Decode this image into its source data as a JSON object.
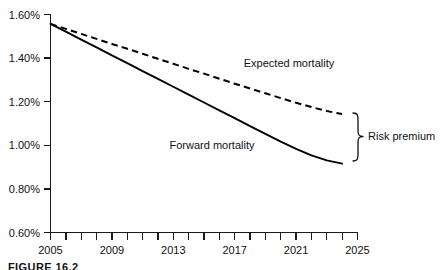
{
  "chart_data": {
    "type": "line",
    "title": "",
    "xlabel": "",
    "ylabel": "",
    "xlim": [
      2005,
      2025
    ],
    "ylim": [
      0.6,
      1.6
    ],
    "grid": false,
    "legend_position": "inline-annotations",
    "y_tick_labels": [
      "1.60%",
      "1.40%",
      "1.20%",
      "1.00%",
      "0.80%",
      "0.60%"
    ],
    "y_tick_values": [
      1.6,
      1.4,
      1.2,
      1.0,
      0.8,
      0.6
    ],
    "x_tick_labels": [
      "2005",
      "2009",
      "2013",
      "2017",
      "2021",
      "2025"
    ],
    "x_tick_values": [
      2005,
      2009,
      2013,
      2017,
      2021,
      2025
    ],
    "x_minor_ticks": [
      2005,
      2006,
      2007,
      2008,
      2009,
      2010,
      2011,
      2012,
      2013,
      2014,
      2015,
      2016,
      2017,
      2018,
      2019,
      2020,
      2021,
      2022,
      2023,
      2024,
      2025
    ],
    "x": [
      2005,
      2006,
      2007,
      2008,
      2009,
      2010,
      2011,
      2012,
      2013,
      2014,
      2015,
      2016,
      2017,
      2018,
      2019,
      2020,
      2021,
      2022,
      2023,
      2024
    ],
    "series": [
      {
        "name": "Expected mortality",
        "style": "dashed",
        "values": [
          1.555,
          1.532,
          1.509,
          1.486,
          1.463,
          1.441,
          1.418,
          1.395,
          1.372,
          1.349,
          1.327,
          1.304,
          1.281,
          1.259,
          1.237,
          1.215,
          1.194,
          1.174,
          1.156,
          1.142
        ]
      },
      {
        "name": "Forward mortality",
        "style": "solid",
        "values": [
          1.555,
          1.519,
          1.483,
          1.447,
          1.411,
          1.375,
          1.339,
          1.303,
          1.267,
          1.231,
          1.195,
          1.159,
          1.123,
          1.087,
          1.051,
          1.016,
          0.983,
          0.953,
          0.93,
          0.915
        ]
      }
    ],
    "annotations": [
      {
        "text": "Expected mortality",
        "x": 2020.2,
        "y": 1.335
      },
      {
        "text": "Forward mortality",
        "x": 2015.3,
        "y": 1.0
      },
      {
        "text": "Risk premium",
        "x": 2026.2,
        "y": 1.03
      }
    ],
    "bracket": {
      "label": "Risk premium",
      "top_value": 1.142,
      "bottom_value": 0.915,
      "at_year": 2024.6
    }
  },
  "axis": {
    "y_labels": [
      "1.60%",
      "1.40%",
      "1.20%",
      "1.00%",
      "0.80%",
      "0.60%"
    ],
    "x_labels": [
      "2005",
      "2009",
      "2013",
      "2017",
      "2021",
      "2025"
    ]
  },
  "labels": {
    "expected_mortality": "Expected mortality",
    "forward_mortality": "Forward mortality",
    "risk_premium": "Risk premium"
  },
  "caption": {
    "text": "FIGURE 16.2"
  },
  "colors": {
    "line": "#000000",
    "axis": "#1a1a1a",
    "text": "#111111",
    "background": "#ffffff"
  }
}
